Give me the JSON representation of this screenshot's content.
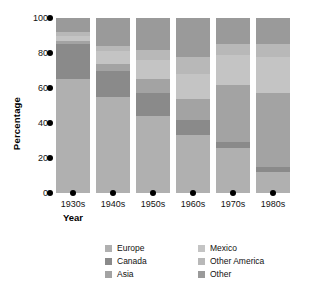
{
  "chart_data": {
    "type": "bar",
    "stacked": true,
    "title": "",
    "xlabel": "Year",
    "ylabel": "Percentage",
    "categories": [
      "1930s",
      "1940s",
      "1950s",
      "1960s",
      "1970s",
      "1980s"
    ],
    "ylim": [
      0,
      100
    ],
    "yticks": [
      0,
      20,
      40,
      60,
      80,
      100
    ],
    "grid": false,
    "legend_position": "bottom",
    "series": [
      {
        "name": "Europe",
        "color": "#b0b0b0",
        "values": [
          65,
          55,
          44,
          33,
          26,
          12
        ]
      },
      {
        "name": "Canada",
        "color": "#8a8a8a",
        "values": [
          20,
          15,
          13,
          9,
          3,
          3
        ]
      },
      {
        "name": "Asia",
        "color": "#a3a3a3",
        "values": [
          2,
          4,
          8,
          12,
          33,
          42
        ]
      },
      {
        "name": "Mexico",
        "color": "#c4c4c4",
        "values": [
          3,
          7,
          11,
          14,
          17,
          21
        ]
      },
      {
        "name": "Other America",
        "color": "#b8b8b8",
        "values": [
          2,
          3,
          6,
          10,
          6,
          7
        ]
      },
      {
        "name": "Other",
        "color": "#9a9a9a",
        "values": [
          8,
          16,
          18,
          22,
          15,
          15
        ]
      }
    ]
  },
  "axes": {
    "y_title": "Percentage",
    "x_title": "Year",
    "y_tick_labels": [
      "100",
      "80",
      "60",
      "40",
      "20",
      "0"
    ]
  },
  "legend": {
    "left_column": [
      {
        "label": "Europe",
        "color": "#b0b0b0"
      },
      {
        "label": "Canada",
        "color": "#8a8a8a"
      },
      {
        "label": "Asia",
        "color": "#a3a3a3"
      }
    ],
    "right_column": [
      {
        "label": "Mexico",
        "color": "#c4c4c4"
      },
      {
        "label": "Other America",
        "color": "#b8b8b8"
      },
      {
        "label": "Other",
        "color": "#9a9a9a"
      }
    ]
  }
}
